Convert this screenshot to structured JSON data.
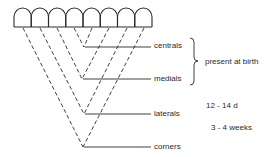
{
  "diagram": {
    "type": "tooth-eruption-schematic",
    "teeth_count": 8,
    "colors": {
      "line": "#2a2a2a",
      "background": "#ffffff"
    },
    "tooth_pairs": [
      {
        "name": "centrals",
        "label": "centrals"
      },
      {
        "name": "medials",
        "label": "medials"
      },
      {
        "name": "laterals",
        "label": "laterals"
      },
      {
        "name": "corners",
        "label": "corners"
      }
    ],
    "annotations": {
      "brace_label": "present at birth",
      "laterals_time": "12 - 14 d",
      "corners_time": "3 - 4 weeks"
    }
  }
}
